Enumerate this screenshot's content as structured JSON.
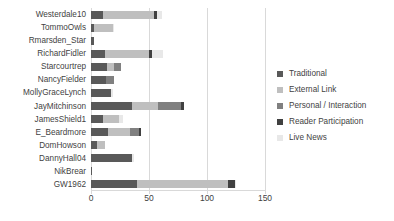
{
  "chart_data": {
    "type": "bar",
    "orientation": "horizontal",
    "stacked": true,
    "title": "",
    "xlabel": "",
    "ylabel": "",
    "xlim": [
      0,
      150
    ],
    "xticks": [
      0,
      50,
      100,
      150
    ],
    "grid": true,
    "legend_position": "right",
    "categories": [
      "Westerdale10",
      "TommoOwls",
      "Rmarsden_Star",
      "RichardFidler",
      "Starcourtrep",
      "NancyFielder",
      "MollyGraceLynch",
      "JayMitchinson",
      "JamesShield1",
      "E_Beardmore",
      "DomHowson",
      "DannyHall04",
      "NikBrear",
      "GW1962"
    ],
    "series": [
      {
        "name": "Traditional",
        "color": "#595959",
        "values": [
          10,
          3,
          3,
          12,
          14,
          13,
          17,
          35,
          10,
          15,
          5,
          35,
          1,
          40
        ]
      },
      {
        "name": "External Link",
        "color": "#bfbfbf",
        "values": [
          44,
          16,
          0,
          38,
          6,
          0,
          0,
          23,
          14,
          19,
          7,
          0,
          0,
          78
        ]
      },
      {
        "name": "Personal / Interaction",
        "color": "#808080",
        "values": [
          0,
          0,
          0,
          0,
          6,
          7,
          0,
          20,
          0,
          7,
          0,
          0,
          0,
          0
        ]
      },
      {
        "name": "Reader Participation",
        "color": "#404040",
        "values": [
          3,
          0,
          0,
          3,
          0,
          0,
          0,
          2,
          0,
          2,
          0,
          0,
          0,
          6
        ]
      },
      {
        "name": "Live News",
        "color": "#e8e8e8",
        "values": [
          4,
          1,
          0,
          9,
          0,
          0,
          2,
          0,
          4,
          0,
          0,
          2,
          0,
          1
        ]
      }
    ]
  },
  "axis": {
    "tick_labels": [
      "0",
      "50",
      "100",
      "150"
    ]
  },
  "colors": {
    "gridline": "#d9d9d9",
    "text": "#3f3f3f",
    "background": "#ffffff"
  }
}
